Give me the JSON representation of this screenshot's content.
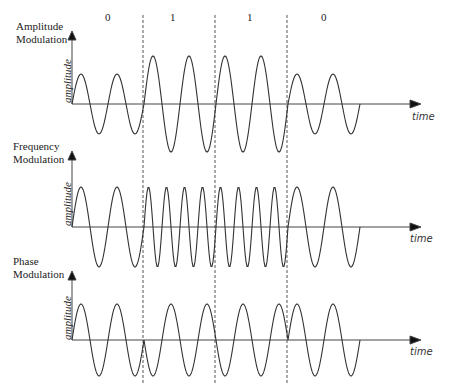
{
  "bits": [
    "0",
    "1",
    "1",
    "0"
  ],
  "panels": [
    {
      "id": "am",
      "title": "Amplitude\nModulation",
      "y_label": "amplitude",
      "x_label": "time"
    },
    {
      "id": "fm",
      "title": "Frequency\nModulation",
      "y_label": "amplitude",
      "x_label": "time"
    },
    {
      "id": "pm",
      "title": "Phase\nModulation",
      "y_label": "amplitude",
      "x_label": "time"
    }
  ],
  "colors": {
    "line": "#333333",
    "axis": "#444444",
    "dash": "#555555",
    "background": "#ffffff"
  }
}
